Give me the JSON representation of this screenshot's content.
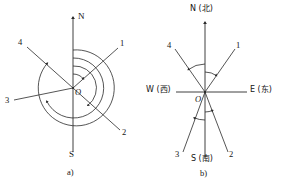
{
  "figure": {
    "background_color": "#ffffff",
    "stroke_color": "#2a2a2a",
    "text_color": "#141414",
    "panels": [
      {
        "id": "panel-a",
        "caption": "a)",
        "origin_label": "O",
        "axis_labels": {
          "north": "N",
          "south": "S"
        },
        "ray_labels": [
          "1",
          "2",
          "3",
          "4"
        ],
        "arc_count": 4,
        "description_type": "compass-bearing-diagram"
      },
      {
        "id": "panel-b",
        "caption": "b)",
        "origin_label": "O",
        "axis_labels": {
          "north": "N (北)",
          "south": "S (南)",
          "east": "E (东)",
          "west": "W (西)"
        },
        "ray_labels": [
          "1",
          "2",
          "3",
          "4"
        ],
        "arc_count": 4,
        "description_type": "compass-bearing-diagram"
      }
    ]
  },
  "labels": {
    "a": {
      "n": "N",
      "s": "S",
      "o": "O",
      "r1": "1",
      "r2": "2",
      "r3": "3",
      "r4": "4",
      "caption": "a)"
    },
    "b": {
      "n": "N (北)",
      "s": "S (南)",
      "e": "E (东)",
      "w": "W (西)",
      "o": "O",
      "r1": "1",
      "r2": "2",
      "r3": "3",
      "r4": "4",
      "caption": "b)"
    }
  }
}
